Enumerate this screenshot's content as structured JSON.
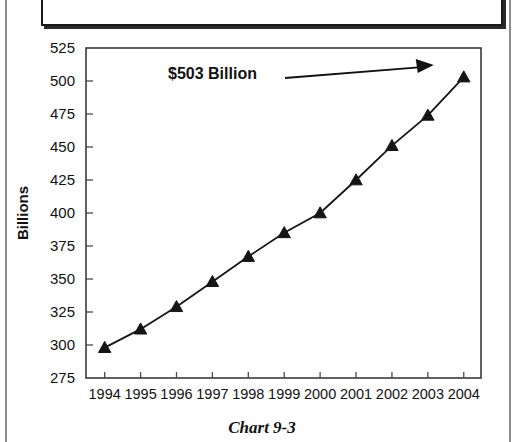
{
  "page": {
    "title_box_text": "",
    "caption": "Chart 9-3"
  },
  "annotation": {
    "label": "$503 Billion",
    "target_category": "2004",
    "target_value": 503
  },
  "colors": {
    "ink": "#151515",
    "frame": "#3a3a3a",
    "background": "#ffffff",
    "page_rule": "#8d8d8d"
  },
  "chart_data": {
    "type": "line",
    "title": "",
    "subtitle": "",
    "xlabel": "",
    "ylabel": "Billions",
    "categories": [
      "1994",
      "1995",
      "1996",
      "1997",
      "1998",
      "1999",
      "2000",
      "2001",
      "2002",
      "2003",
      "2004"
    ],
    "values": [
      298,
      312,
      329,
      348,
      367,
      385,
      400,
      425,
      451,
      474,
      503
    ],
    "series": [
      {
        "name": "Billions",
        "values": [
          298,
          312,
          329,
          348,
          367,
          385,
          400,
          425,
          451,
          474,
          503
        ],
        "marker": "triangle",
        "color": "#151515"
      }
    ],
    "ylim": [
      275,
      525
    ],
    "ytick_values": [
      275,
      300,
      325,
      350,
      375,
      400,
      425,
      450,
      475,
      500,
      525
    ],
    "ytick_labels": [
      "275",
      "300",
      "325",
      "350",
      "375",
      "400",
      "425",
      "450",
      "475",
      "500",
      "525"
    ],
    "xtick_labels": [
      "1994",
      "1995",
      "1996",
      "1997",
      "1998",
      "1999",
      "2000",
      "2001",
      "2002",
      "2003",
      "2004"
    ],
    "grid": false,
    "legend": false,
    "legend_position": "none",
    "annotations": [
      {
        "text": "$503 Billion",
        "points_to": "2004",
        "value": 503
      }
    ]
  }
}
